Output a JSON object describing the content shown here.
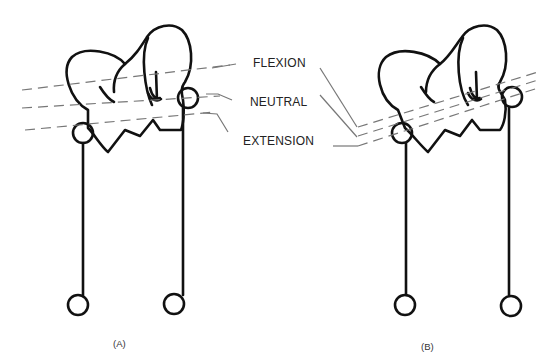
{
  "diagram": {
    "labels": {
      "flexion": "FLEXION",
      "neutral": "NEUTRAL",
      "extension": "EXTENSION"
    },
    "panels": [
      {
        "id": "A",
        "caption": "(A)"
      },
      {
        "id": "B",
        "caption": "(B)"
      }
    ],
    "colors": {
      "outline": "#111111",
      "axis_lines": "#777777",
      "text": "#222222"
    }
  }
}
